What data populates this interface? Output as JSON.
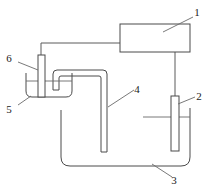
{
  "figure": {
    "background_color": "#ffffff",
    "line_color": "#4a4a4a",
    "label_color": "#222222",
    "width": 210,
    "height": 187
  },
  "labels": [
    {
      "id": "1",
      "text": "1",
      "refers_to": "power-supply",
      "x": 197,
      "y": 16
    },
    {
      "id": "2",
      "text": "2",
      "refers_to": "right-electrode",
      "x": 199,
      "y": 100
    },
    {
      "id": "3",
      "text": "3",
      "refers_to": "large-vessel",
      "x": 174,
      "y": 180
    },
    {
      "id": "4",
      "text": "4",
      "refers_to": "gas-delivery-tube",
      "x": 137,
      "y": 93
    },
    {
      "id": "5",
      "text": "5",
      "refers_to": "small-beaker",
      "x": 9,
      "y": 109
    },
    {
      "id": "6",
      "text": "6",
      "refers_to": "left-electrode",
      "x": 9,
      "y": 64
    }
  ],
  "components": [
    {
      "name": "power-supply",
      "type": "rectangle",
      "description": "power supply box"
    },
    {
      "name": "left-electrode",
      "type": "bar",
      "description": "electrode in small beaker"
    },
    {
      "name": "right-electrode",
      "type": "bar",
      "description": "electrode in large vessel"
    },
    {
      "name": "small-beaker",
      "type": "vessel",
      "description": "small beaker with liquid"
    },
    {
      "name": "large-vessel",
      "type": "vessel",
      "description": "large vessel with liquid"
    },
    {
      "name": "gas-delivery-tube",
      "type": "tube",
      "description": "inverted U gas delivery tube"
    },
    {
      "name": "left-wire",
      "type": "wire",
      "description": "wire from power supply to left electrode"
    },
    {
      "name": "right-wire",
      "type": "wire",
      "description": "wire from power supply to right electrode"
    }
  ]
}
